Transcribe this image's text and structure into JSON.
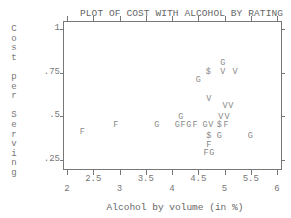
{
  "chart_data": {
    "type": "scatter",
    "title": "PLOT OF COST WITH ALCOHOL BY RATING",
    "xlabel": "Alcohol by volume (in %)",
    "ylabel": "Cost per Serving",
    "xlim": [
      1.9,
      6.1
    ],
    "ylim": [
      0.2,
      1.05
    ],
    "grid": false,
    "legend": "none (point symbols denote rating: F, G, V, $)",
    "x_ticks_lower": [
      "2",
      "3",
      "4",
      "5",
      "6"
    ],
    "x_ticks_upper": [
      "2.5",
      "3.5",
      "4.5",
      "5.5"
    ],
    "y_ticks": [
      "1",
      ".75",
      ".5",
      ".25"
    ],
    "points": [
      {
        "x": 2.29,
        "y": 0.4,
        "symbol": "F"
      },
      {
        "x": 2.93,
        "y": 0.44,
        "symbol": "F"
      },
      {
        "x": 3.71,
        "y": 0.44,
        "symbol": "G"
      },
      {
        "x": 4.17,
        "y": 0.49,
        "symbol": "G"
      },
      {
        "x": 4.1,
        "y": 0.44,
        "symbol": "G"
      },
      {
        "x": 4.21,
        "y": 0.44,
        "symbol": "F"
      },
      {
        "x": 4.32,
        "y": 0.44,
        "symbol": "G"
      },
      {
        "x": 4.44,
        "y": 0.44,
        "symbol": "F"
      },
      {
        "x": 4.63,
        "y": 0.44,
        "symbol": "G"
      },
      {
        "x": 4.74,
        "y": 0.44,
        "symbol": "V"
      },
      {
        "x": 4.9,
        "y": 0.44,
        "symbol": "$"
      },
      {
        "x": 5.03,
        "y": 0.44,
        "symbol": "F"
      },
      {
        "x": 4.93,
        "y": 0.49,
        "symbol": "V"
      },
      {
        "x": 5.05,
        "y": 0.49,
        "symbol": "V"
      },
      {
        "x": 5.01,
        "y": 0.55,
        "symbol": "V"
      },
      {
        "x": 5.12,
        "y": 0.55,
        "symbol": "V"
      },
      {
        "x": 4.7,
        "y": 0.59,
        "symbol": "V"
      },
      {
        "x": 4.7,
        "y": 0.38,
        "symbol": "$"
      },
      {
        "x": 4.9,
        "y": 0.38,
        "symbol": "G"
      },
      {
        "x": 4.7,
        "y": 0.33,
        "symbol": "F"
      },
      {
        "x": 4.65,
        "y": 0.28,
        "symbol": "F"
      },
      {
        "x": 4.76,
        "y": 0.28,
        "symbol": "G"
      },
      {
        "x": 5.49,
        "y": 0.38,
        "symbol": "G"
      },
      {
        "x": 4.97,
        "y": 0.8,
        "symbol": "G"
      },
      {
        "x": 4.69,
        "y": 0.75,
        "symbol": "$"
      },
      {
        "x": 4.97,
        "y": 0.75,
        "symbol": "V"
      },
      {
        "x": 5.2,
        "y": 0.75,
        "symbol": "V"
      },
      {
        "x": 4.5,
        "y": 0.7,
        "symbol": "G"
      }
    ]
  }
}
